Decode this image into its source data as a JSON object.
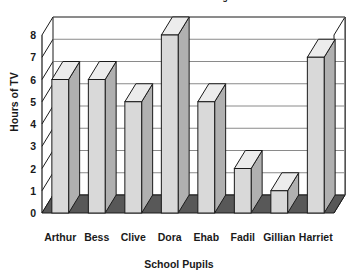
{
  "chart_data": {
    "type": "bar",
    "title": "Number of hours watched during the week",
    "title_clipped": true,
    "xlabel": "School Pupils",
    "ylabel": "Hours of TV",
    "categories": [
      "Arthur",
      "Bess",
      "Clive",
      "Dora",
      "Ehab",
      "Fadil",
      "Gillian",
      "Harriet"
    ],
    "values": [
      6,
      6,
      5,
      8,
      5,
      2,
      1,
      7
    ],
    "ylim": [
      0,
      8
    ],
    "yticks": [
      0,
      1,
      2,
      3,
      4,
      5,
      6,
      7,
      8
    ],
    "ytick_labels": [
      "0",
      "1",
      "2",
      "3",
      "4",
      "5",
      "6",
      "7",
      "8"
    ],
    "grid": true,
    "grid_axis": "y",
    "legend": false,
    "style": "3d-bars",
    "colors": {
      "bar_face": "#d9d9d9",
      "bar_side": "#b0b0b0",
      "bar_top": "#ececec",
      "bar_outline": "#1a1a1a",
      "floor": "#585858",
      "plot_background": "#ffffff",
      "grid_line": "#8a8a8a",
      "axis_line": "#1a1a1a",
      "text": "#1a1a1a"
    }
  }
}
